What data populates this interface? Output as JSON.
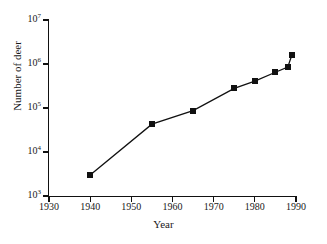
{
  "chart_data": {
    "type": "line",
    "title": "",
    "subtitle": "",
    "xlabel": "Year",
    "ylabel": "Number of deer",
    "xlim": [
      1930,
      1990
    ],
    "ylim": [
      1000,
      10000000
    ],
    "yscale": "log",
    "xscale": "linear",
    "grid": false,
    "legend": null,
    "marker": "filled-square",
    "line_color": "#111111",
    "marker_color": "#111111",
    "xticks": [
      1930,
      1940,
      1950,
      1960,
      1970,
      1980,
      1990
    ],
    "xticklabels": [
      "1930",
      "1940",
      "1950",
      "1960",
      "1970",
      "1980",
      "1990"
    ],
    "yticks": [
      1000,
      10000,
      100000,
      1000000,
      10000000
    ],
    "yticklabels": [
      "10³",
      "10⁴",
      "10⁵",
      "10⁶",
      "10⁷"
    ],
    "ytick_mantissa": [
      "10",
      "10",
      "10",
      "10",
      "10"
    ],
    "ytick_exponent": [
      "3",
      "4",
      "5",
      "6",
      "7"
    ],
    "x": [
      1940,
      1955,
      1965,
      1975,
      1980,
      1985,
      1988,
      1989
    ],
    "values": [
      3000,
      43000,
      87000,
      280000,
      410000,
      650000,
      850000,
      1600000
    ],
    "points": [
      {
        "x": 1940,
        "y": 3000
      },
      {
        "x": 1955,
        "y": 43000
      },
      {
        "x": 1965,
        "y": 87000
      },
      {
        "x": 1975,
        "y": 280000
      },
      {
        "x": 1980,
        "y": 410000
      },
      {
        "x": 1985,
        "y": 650000
      },
      {
        "x": 1988,
        "y": 850000
      },
      {
        "x": 1989,
        "y": 1600000
      }
    ]
  },
  "axes": {
    "x_title": "Year",
    "y_title": "Number of deer"
  }
}
